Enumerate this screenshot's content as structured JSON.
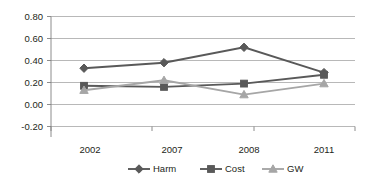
{
  "chart_data": {
    "type": "line",
    "title": "",
    "xlabel": "",
    "ylabel": "",
    "categories": [
      "2002",
      "2007",
      "2008",
      "2011"
    ],
    "series": [
      {
        "name": "Harm",
        "marker": "diamond",
        "color": "#595959",
        "values": [
          0.33,
          0.38,
          0.52,
          0.29
        ]
      },
      {
        "name": "Cost",
        "marker": "square",
        "color": "#595959",
        "values": [
          0.17,
          0.16,
          0.19,
          0.27
        ]
      },
      {
        "name": "GW",
        "marker": "triangle",
        "color": "#a6a6a6",
        "values": [
          0.13,
          0.22,
          0.09,
          0.19
        ]
      }
    ],
    "ylim": [
      -0.2,
      0.8
    ],
    "yticks": [
      "0.80",
      "0.60",
      "0.40",
      "0.20",
      "0.00",
      "-0.20"
    ],
    "ytick_values": [
      0.8,
      0.6,
      0.4,
      0.2,
      0.0,
      -0.2
    ],
    "grid": true,
    "legend_position": "bottom"
  },
  "legend": {
    "items": [
      {
        "label": "Harm",
        "marker": "diamond",
        "color": "#595959"
      },
      {
        "label": "Cost",
        "marker": "square",
        "color": "#595959"
      },
      {
        "label": "GW",
        "marker": "triangle",
        "color": "#a6a6a6"
      }
    ]
  },
  "colors": {
    "gridline": "#a6a6a6",
    "axis": "#808080",
    "dark_series": "#595959",
    "light_series": "#a6a6a6",
    "text": "#231f20",
    "background": "#ffffff"
  }
}
